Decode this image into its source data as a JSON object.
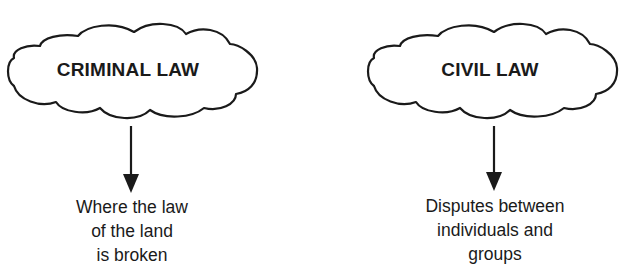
{
  "diagram": {
    "nodes": [
      {
        "title": "CRIMINAL LAW",
        "description_lines": [
          "Where the law",
          "of the land",
          "is broken"
        ]
      },
      {
        "title": "CIVIL LAW",
        "description_lines": [
          "Disputes between",
          "individuals and",
          "groups"
        ]
      }
    ],
    "colors": {
      "ink": "#1a1a1a",
      "background": "#ffffff"
    }
  }
}
